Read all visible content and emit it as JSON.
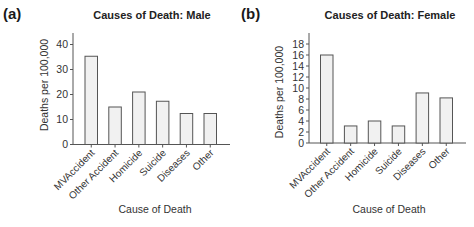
{
  "chart_data": [
    {
      "panel": "(a)",
      "type": "bar",
      "title": "Causes of Death: Male",
      "xlabel": "Cause of Death",
      "ylabel": "Deaths per 100,000",
      "categories": [
        "MVAccident",
        "Other Accident",
        "Homicide",
        "Suicide",
        "Diseases",
        "Other"
      ],
      "values": [
        35.3,
        15,
        21,
        17.3,
        12.4,
        12.4
      ],
      "yticks": [
        0,
        10,
        20,
        30,
        40
      ],
      "ylim": [
        0,
        45
      ],
      "grid": false,
      "legend": null
    },
    {
      "panel": "(b)",
      "type": "bar",
      "title": "Causes of Death: Female",
      "xlabel": "Cause of Death",
      "ylabel": "Deaths per 100,000",
      "categories": [
        "MVAccident",
        "Other Accident",
        "Homicide",
        "Suicide",
        "Diseases",
        "Other"
      ],
      "values": [
        16,
        3.1,
        4,
        3.1,
        9.1,
        8.2
      ],
      "yticks": [
        0,
        2,
        4,
        6,
        8,
        10,
        12,
        14,
        16,
        18
      ],
      "ylim": [
        0,
        20
      ],
      "grid": false,
      "legend": null
    }
  ],
  "colors": {
    "bar_fill": "#f1f1f1",
    "bar_stroke": "#555555",
    "axis": "#555555",
    "text": "#333333"
  }
}
